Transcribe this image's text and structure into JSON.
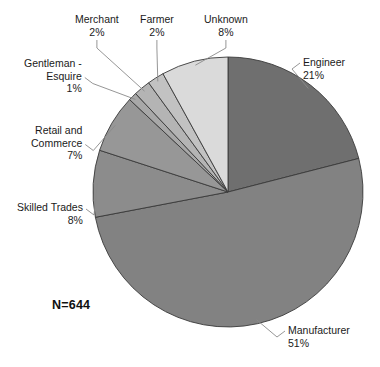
{
  "chart_data": {
    "type": "pie",
    "title": "",
    "subtitle": "",
    "xlabel": "",
    "ylabel": "",
    "legend_position": "none",
    "grid": false,
    "total_label": "N=644",
    "total_value": 644,
    "categories": [
      "Engineer",
      "Manufacturer",
      "Skilled Trades",
      "Retail and Commerce",
      "Gentleman - Esquire",
      "Merchant",
      "Farmer",
      "Unknown"
    ],
    "values": [
      21,
      51,
      8,
      7,
      1,
      2,
      2,
      8
    ],
    "value_unit": "%",
    "slices": [
      {
        "name": "engineer",
        "label": "Engineer",
        "percent_label": "21%",
        "value": 21,
        "color": "#6f6f6f",
        "start_angle": 0,
        "end_angle": 75.6,
        "label_x": 303,
        "label_y": 56,
        "label_align": "right"
      },
      {
        "name": "manufacturer",
        "label": "Manufacturer",
        "percent_label": "51%",
        "value": 51,
        "color": "#828282",
        "start_angle": 75.6,
        "end_angle": 259.2,
        "label_x": 288,
        "label_y": 324,
        "label_align": "right"
      },
      {
        "name": "skilled-trades",
        "label": "Skilled Trades",
        "percent_label": "8%",
        "value": 8,
        "color": "#8c8c8c",
        "start_angle": 259.2,
        "end_angle": 288.0,
        "label_x": 17,
        "label_y": 201,
        "label_align": "left"
      },
      {
        "name": "retail-and-commerce",
        "label": "Retail and\nCommerce",
        "percent_label": "7%",
        "value": 7,
        "color": "#979797",
        "start_angle": 288.0,
        "end_angle": 313.2,
        "label_x": 31,
        "label_y": 124,
        "label_align": "left"
      },
      {
        "name": "gentleman-esquire",
        "label": "Gentleman -\nEsquire",
        "percent_label": "1%",
        "value": 1,
        "color": "#a8a8a8",
        "start_angle": 313.2,
        "end_angle": 316.8,
        "label_x": 24,
        "label_y": 57,
        "label_align": "left"
      },
      {
        "name": "merchant",
        "label": "Merchant",
        "percent_label": "2%",
        "value": 2,
        "color": "#b4b4b4",
        "start_angle": 316.8,
        "end_angle": 324.0,
        "label_x": 75,
        "label_y": 13,
        "label_align": "center"
      },
      {
        "name": "farmer",
        "label": "Farmer",
        "percent_label": "2%",
        "value": 2,
        "color": "#c2c2c2",
        "start_angle": 324.0,
        "end_angle": 331.2,
        "label_x": 140,
        "label_y": 13,
        "label_align": "center"
      },
      {
        "name": "unknown",
        "label": "Unknown",
        "percent_label": "8%",
        "value": 8,
        "color": "#dadada",
        "start_angle": 331.2,
        "end_angle": 360.0,
        "label_x": 204,
        "label_y": 13,
        "label_align": "center"
      }
    ],
    "geometry": {
      "center_x": 228,
      "center_y": 192,
      "radius": 135
    }
  }
}
